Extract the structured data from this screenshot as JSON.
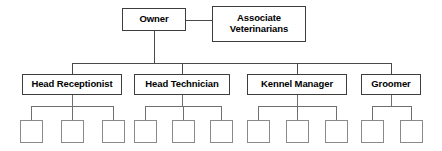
{
  "diagram": {
    "type": "organizational-chart",
    "colors": {
      "background": "#ffffff",
      "node_border": "#3d3d3d",
      "leaf_border": "#8a8a8a",
      "connector": "#4a4a4a",
      "text": "#000000"
    },
    "nodes": {
      "owner": {
        "label": "Owner"
      },
      "associate_veterinarians": {
        "label": "Associate\nVeterinarians"
      },
      "head_receptionist": {
        "label": "Head Receptionist"
      },
      "head_technician": {
        "label": "Head Technician"
      },
      "kennel_manager": {
        "label": "Kennel Manager"
      },
      "groomer": {
        "label": "Groomer"
      }
    },
    "leaves": {
      "label": "",
      "count": 11,
      "groups": [
        {
          "parent": "head_receptionist",
          "count": 3
        },
        {
          "parent": "head_technician",
          "count": 3
        },
        {
          "parent": "kennel_manager",
          "count": 3
        },
        {
          "parent": "groomer",
          "count": 2
        }
      ]
    }
  }
}
